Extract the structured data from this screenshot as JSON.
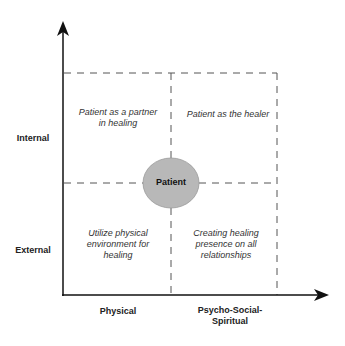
{
  "diagram": {
    "y_axis": {
      "labels": [
        "Internal",
        "External"
      ]
    },
    "x_axis": {
      "labels": [
        "Physical",
        "Psycho-Social-\nSpiritual"
      ],
      "label_physical": "Physical",
      "label_psycho_line1": "Psycho-Social-",
      "label_psycho_line2": "Spiritual"
    },
    "y_label_internal": "Internal",
    "y_label_external": "External",
    "center": {
      "label": "Patient",
      "fill": "#b8b8b8"
    },
    "quadrants": {
      "top_left": {
        "line1": "Patient as a partner",
        "line2": "in healing"
      },
      "top_right": {
        "line1": "Patient as the healer"
      },
      "bottom_left": {
        "line1": "Utilize physical",
        "line2": "environment for",
        "line3": "healing"
      },
      "bottom_right": {
        "line1": "Creating healing",
        "line2": "presence on all",
        "line3": "relationships"
      }
    },
    "colors": {
      "axis": "#111111",
      "dashed": "#555555",
      "text": "#333333"
    }
  }
}
